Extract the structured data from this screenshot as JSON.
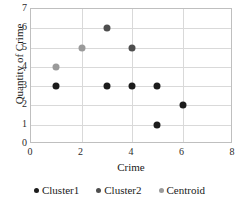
{
  "chart_data": {
    "type": "scatter",
    "title": "",
    "xlabel": "Crime",
    "ylabel": "Quantity of Crime",
    "xlim": [
      0,
      8
    ],
    "ylim": [
      0,
      7
    ],
    "xticks": [
      "0",
      "2",
      "4",
      "6",
      "8"
    ],
    "yticks": [
      "0",
      "1",
      "2",
      "3",
      "4",
      "5",
      "6",
      "7"
    ],
    "grid": "both",
    "legend_position": "bottom",
    "series": [
      {
        "name": "Cluster1",
        "color": "#1c1c1c",
        "points": [
          {
            "x": 1,
            "y": 3
          },
          {
            "x": 3,
            "y": 3
          },
          {
            "x": 4,
            "y": 3
          },
          {
            "x": 5,
            "y": 3
          },
          {
            "x": 5,
            "y": 1
          },
          {
            "x": 6,
            "y": 2
          }
        ]
      },
      {
        "name": "Cluster2",
        "color": "#4e4e4e",
        "points": [
          {
            "x": 3,
            "y": 6
          },
          {
            "x": 4,
            "y": 5
          }
        ]
      },
      {
        "name": "Centroid",
        "color": "#9a9a9a",
        "points": [
          {
            "x": 1,
            "y": 4
          },
          {
            "x": 2,
            "y": 5
          }
        ]
      }
    ]
  }
}
